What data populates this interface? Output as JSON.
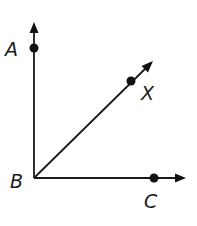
{
  "diagram": {
    "type": "angle-rays",
    "vertex": {
      "label": "B",
      "x": 34,
      "y": 178
    },
    "rays": [
      {
        "name": "ray-BA",
        "through": "A",
        "direction": "up"
      },
      {
        "name": "ray-BX",
        "through": "X",
        "direction": "up-right"
      },
      {
        "name": "ray-BC",
        "through": "C",
        "direction": "right"
      }
    ],
    "points": [
      {
        "label": "A",
        "x": 34,
        "y": 48
      },
      {
        "label": "X",
        "x": 131,
        "y": 81
      },
      {
        "label": "C",
        "x": 154,
        "y": 178
      }
    ],
    "labels": {
      "A": "A",
      "B": "B",
      "C": "C",
      "X": "X"
    },
    "colors": {
      "stroke": "#1a1a1a",
      "background": "#ffffff"
    }
  }
}
